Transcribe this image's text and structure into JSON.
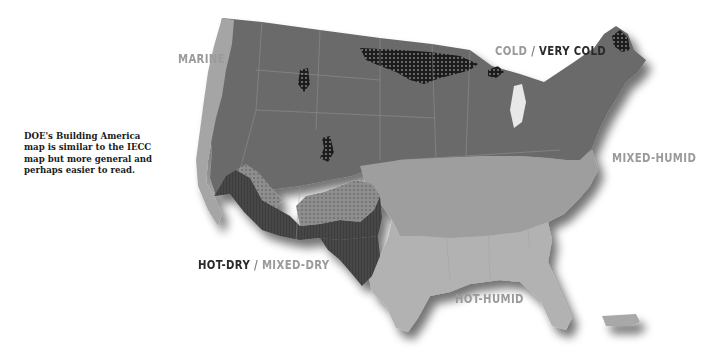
{
  "caption": {
    "lines": [
      "DOE's Building America",
      "map is similar to the IECC",
      "map but more general and",
      "perhaps easier to read."
    ]
  },
  "labels": {
    "marine": "MARINE",
    "cold": "COLD",
    "separator": " / ",
    "very_cold": "VERY COLD",
    "mixed_humid": "MIXED-HUMID",
    "hot_dry": "HOT-DRY",
    "mixed_dry": "MIXED-DRY",
    "hot_humid": "HOT-HUMID"
  },
  "zones": [
    {
      "name": "Marine",
      "color": "#a7a7a7"
    },
    {
      "name": "Cold",
      "color": "#6d6d6d"
    },
    {
      "name": "Very Cold",
      "color": "#1e1e1e",
      "pattern": "dotted"
    },
    {
      "name": "Mixed-Humid",
      "color": "#9c9c9c"
    },
    {
      "name": "Hot-Dry",
      "color": "#4a4a4a",
      "pattern": "lined"
    },
    {
      "name": "Mixed-Dry",
      "color": "#888888",
      "pattern": "dotted"
    },
    {
      "name": "Hot-Humid",
      "color": "#b3b3b3"
    }
  ]
}
